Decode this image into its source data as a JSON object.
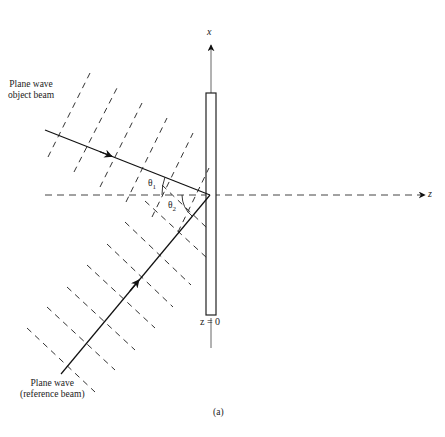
{
  "diagram": {
    "type": "holography-recording-geometry",
    "labels": {
      "object_beam_line1": "Plane wave",
      "object_beam_line2": "object beam",
      "reference_beam_line1": "Plane wave",
      "reference_beam_line2": "(reference beam)",
      "x_axis": "x",
      "z_axis": "z",
      "plate_position": "z = 0",
      "theta1": "θ",
      "theta1_sub": "1",
      "theta2": "θ",
      "theta2_sub": "2",
      "caption": "(a)"
    },
    "colors": {
      "line": "#1a1a1a",
      "axis": "#555555",
      "background": "#ffffff"
    }
  }
}
